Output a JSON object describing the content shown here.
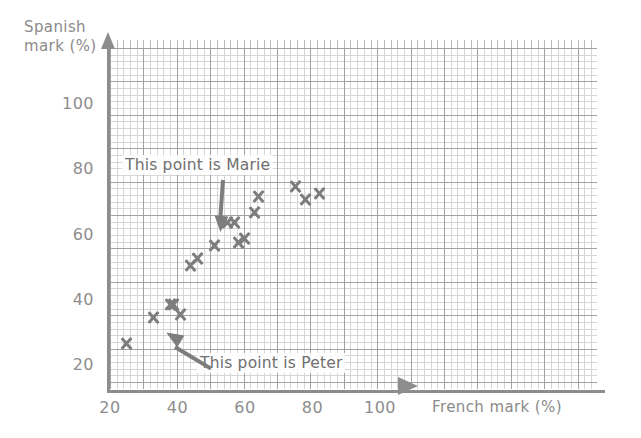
{
  "chart_data": {
    "type": "scatter",
    "title": "",
    "xlabel": "French mark (%)",
    "ylabel": "Spanish mark (%)",
    "xlim": [
      20,
      120
    ],
    "ylim": [
      20,
      110
    ],
    "xticks": [
      20,
      40,
      60,
      80,
      100
    ],
    "yticks": [
      20,
      40,
      60,
      80,
      100
    ],
    "grid": true,
    "grid_minor_step": 2,
    "grid_major_step": 10,
    "legend": "none",
    "marker": "x-cross",
    "marker_color": "#7d7d7d",
    "series": [
      {
        "name": "Students",
        "points": [
          {
            "x": 25,
            "y": 27
          },
          {
            "x": 33,
            "y": 35
          },
          {
            "x": 38,
            "y": 39
          },
          {
            "x": 39,
            "y": 39
          },
          {
            "x": 41,
            "y": 36,
            "label": "Peter"
          },
          {
            "x": 44,
            "y": 51
          },
          {
            "x": 46,
            "y": 53
          },
          {
            "x": 51,
            "y": 57
          },
          {
            "x": 55,
            "y": 64,
            "label": "Marie"
          },
          {
            "x": 57,
            "y": 64
          },
          {
            "x": 58,
            "y": 58
          },
          {
            "x": 60,
            "y": 59
          },
          {
            "x": 63,
            "y": 67
          },
          {
            "x": 64,
            "y": 72
          },
          {
            "x": 75,
            "y": 75
          },
          {
            "x": 78,
            "y": 71
          },
          {
            "x": 82,
            "y": 73
          }
        ]
      }
    ],
    "annotations": [
      {
        "id": "marie",
        "text": "This point is Marie",
        "points_to": {
          "x": 55,
          "y": 64
        }
      },
      {
        "id": "peter",
        "text": "This point is Peter",
        "points_to": {
          "x": 41,
          "y": 36
        }
      }
    ]
  },
  "axes": {
    "y_title": "Spanish\nmark (%)",
    "x_title": "French mark (%)",
    "y_tick_labels": [
      "100",
      "80",
      "60",
      "40",
      "20"
    ],
    "x_tick_labels": [
      "20",
      "40",
      "60",
      "80",
      "100"
    ]
  },
  "colors": {
    "marker": "#7d7d7d",
    "axis": "#8d8d8d",
    "grid_minor": "#c9c9c9",
    "grid_major": "#9a9a9a",
    "text": "#8a8a8a",
    "background": "#ffffff"
  }
}
